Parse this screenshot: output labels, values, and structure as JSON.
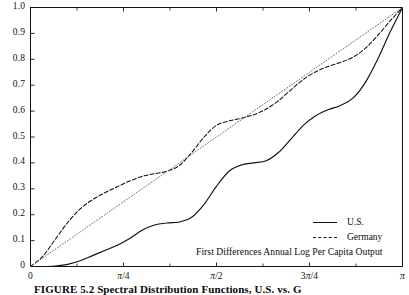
{
  "figure": {
    "caption_label": "FIGURE 5.2",
    "caption_text": "Spectral Distribution Functions, U.S. vs. G",
    "annotation": "First Differences Annual Log Per Capita Output"
  },
  "legend": {
    "position": "bottom-right",
    "entries": [
      {
        "label": "U.S.",
        "style": "solid"
      },
      {
        "label": "Germany",
        "style": "dashed"
      }
    ]
  },
  "axes": {
    "y_ticks": [
      "1.0",
      "0.9",
      "0.8",
      "0.7",
      "0.6",
      "0.5",
      "0.4",
      "0.3",
      "0.2",
      "0.1",
      "0"
    ],
    "x_ticks": [
      "0",
      "π/4",
      "π/2",
      "3π/4",
      "π"
    ],
    "x_tick_values": [
      0,
      0.7853981634,
      1.5707963268,
      2.3561944902,
      3.1415926536
    ],
    "xlim": [
      0,
      3.1415926536
    ],
    "ylim": [
      0,
      1.0
    ]
  },
  "colors": {
    "frame": "#111111",
    "us_line": "#111111",
    "germany_line": "#111111",
    "reference_line": "#666666",
    "background": "#ffffff"
  },
  "chart_data": {
    "type": "line",
    "subtitle": "First Differences Annual Log Per Capita Output",
    "xlabel": "",
    "ylabel": "",
    "xlim": [
      0,
      3.1415926536
    ],
    "ylim": [
      0,
      1.0
    ],
    "grid": false,
    "legend_position": "lower right",
    "x_tick_labels": [
      "0",
      "π/4",
      "π/2",
      "3π/4",
      "π"
    ],
    "y_tick_labels": [
      "0",
      "0.1",
      "0.2",
      "0.3",
      "0.4",
      "0.5",
      "0.6",
      "0.7",
      "0.8",
      "0.9",
      "1.0"
    ],
    "series": [
      {
        "name": "U.S.",
        "style": "solid",
        "x": [
          0.0,
          0.105,
          0.209,
          0.314,
          0.419,
          0.524,
          0.628,
          0.733,
          0.838,
          0.942,
          1.047,
          1.152,
          1.257,
          1.361,
          1.466,
          1.571,
          1.676,
          1.78,
          1.885,
          1.99,
          2.094,
          2.199,
          2.304,
          2.409,
          2.513,
          2.618,
          2.723,
          2.827,
          2.932,
          3.037,
          3.142
        ],
        "y": [
          0.0,
          0.0,
          0.002,
          0.008,
          0.022,
          0.042,
          0.062,
          0.082,
          0.108,
          0.14,
          0.16,
          0.168,
          0.172,
          0.19,
          0.24,
          0.31,
          0.368,
          0.392,
          0.4,
          0.408,
          0.44,
          0.492,
          0.545,
          0.582,
          0.605,
          0.622,
          0.65,
          0.71,
          0.8,
          0.905,
          1.0
        ]
      },
      {
        "name": "Germany",
        "style": "dashed",
        "x": [
          0.0,
          0.105,
          0.209,
          0.314,
          0.419,
          0.524,
          0.628,
          0.733,
          0.838,
          0.942,
          1.047,
          1.152,
          1.257,
          1.361,
          1.466,
          1.571,
          1.676,
          1.78,
          1.885,
          1.99,
          2.094,
          2.199,
          2.304,
          2.409,
          2.513,
          2.618,
          2.723,
          2.827,
          2.932,
          3.037,
          3.142
        ],
        "y": [
          0.0,
          0.04,
          0.105,
          0.17,
          0.222,
          0.258,
          0.285,
          0.308,
          0.33,
          0.348,
          0.358,
          0.368,
          0.39,
          0.44,
          0.5,
          0.545,
          0.562,
          0.572,
          0.586,
          0.608,
          0.64,
          0.682,
          0.722,
          0.752,
          0.772,
          0.788,
          0.808,
          0.842,
          0.892,
          0.948,
          1.0
        ]
      },
      {
        "name": "reference",
        "style": "dotted",
        "x": [
          0.0,
          3.1415926536
        ],
        "y": [
          0.0,
          1.0
        ]
      }
    ]
  }
}
